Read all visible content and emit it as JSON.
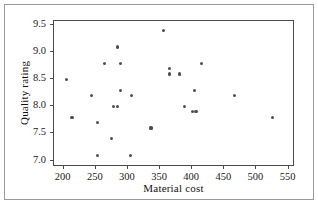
{
  "figure": {
    "background_color": "#ffffff",
    "frame_color": "#4a4a4a",
    "point_color": "#4d4d55"
  },
  "chart_data": {
    "type": "scatter",
    "title": "",
    "xlabel": "Material cost",
    "ylabel": "Quality rating",
    "xlim": [
      185,
      560
    ],
    "ylim": [
      6.88,
      9.58
    ],
    "xticks": [
      200,
      250,
      300,
      350,
      400,
      450,
      500,
      550
    ],
    "xtick_labels": [
      "200",
      "250",
      "300",
      "350",
      "400",
      "450",
      "500",
      "550"
    ],
    "yticks": [
      7.0,
      7.5,
      8.0,
      8.5,
      9.0,
      9.5
    ],
    "ytick_labels": [
      "7.0",
      "7.5",
      "8.0",
      "8.5",
      "9.0",
      "9.5"
    ],
    "grid": false,
    "legend": null,
    "marker": "filled-circle",
    "n_points": 26,
    "x": [
      205,
      213,
      243,
      253,
      253,
      264,
      274,
      278,
      284,
      284,
      288,
      289,
      304,
      305,
      336,
      355,
      365,
      365,
      380,
      388,
      400,
      403,
      406,
      415,
      466,
      525
    ],
    "y": [
      8.5,
      7.8,
      8.2,
      7.7,
      7.1,
      8.8,
      7.4,
      8.0,
      9.1,
      8.0,
      8.8,
      8.3,
      7.1,
      8.2,
      7.6,
      9.4,
      8.7,
      8.6,
      8.6,
      8.0,
      7.9,
      7.9,
      7.9,
      8.8,
      8.2,
      7.8
    ],
    "points": [
      {
        "x": 205,
        "y": 8.5
      },
      {
        "x": 213,
        "y": 7.8
      },
      {
        "x": 243,
        "y": 8.2
      },
      {
        "x": 253,
        "y": 7.7
      },
      {
        "x": 253,
        "y": 7.1
      },
      {
        "x": 264,
        "y": 8.8
      },
      {
        "x": 274,
        "y": 7.4
      },
      {
        "x": 278,
        "y": 8.0
      },
      {
        "x": 284,
        "y": 9.1
      },
      {
        "x": 284,
        "y": 8.0
      },
      {
        "x": 288,
        "y": 8.8
      },
      {
        "x": 289,
        "y": 8.3
      },
      {
        "x": 304,
        "y": 7.1
      },
      {
        "x": 305,
        "y": 8.2
      },
      {
        "x": 336,
        "y": 7.6
      },
      {
        "x": 355,
        "y": 9.4
      },
      {
        "x": 365,
        "y": 8.7
      },
      {
        "x": 365,
        "y": 8.6
      },
      {
        "x": 380,
        "y": 8.6
      },
      {
        "x": 388,
        "y": 8.0
      },
      {
        "x": 400,
        "y": 7.9
      },
      {
        "x": 403,
        "y": 8.3
      },
      {
        "x": 406,
        "y": 7.9
      },
      {
        "x": 415,
        "y": 8.8
      },
      {
        "x": 466,
        "y": 8.2
      },
      {
        "x": 525,
        "y": 7.8
      }
    ]
  }
}
